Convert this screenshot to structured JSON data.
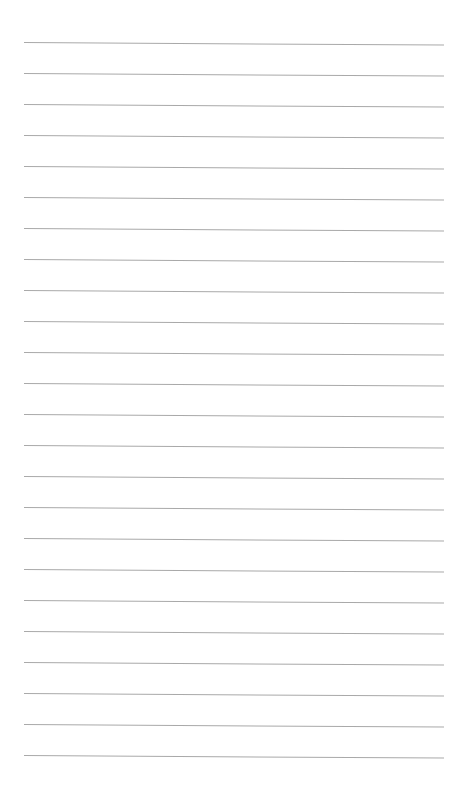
{
  "page": {
    "type": "lined-paper",
    "background_color": "#ffffff",
    "line_color": "#a9a9a9",
    "line_count": 24,
    "first_line_y": 42,
    "line_spacing": 31,
    "line_left_x": 24,
    "line_right_x": 444
  }
}
